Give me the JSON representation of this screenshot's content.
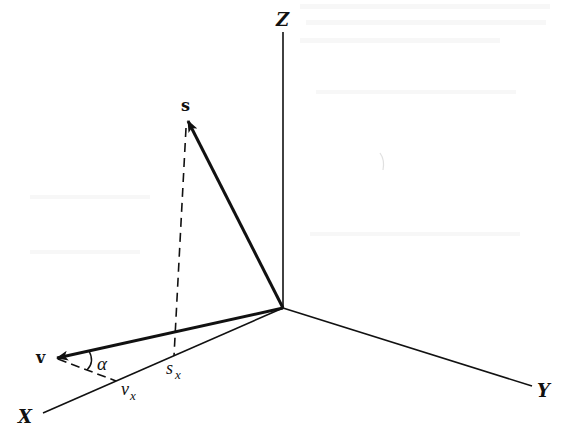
{
  "figure": {
    "axes": {
      "z_label": "Z",
      "y_label": "Y",
      "x_label": "X"
    },
    "vectors": {
      "s_label": "s",
      "v_label": "v"
    },
    "projections": {
      "sx_main": "s",
      "sx_sub": "x",
      "vx_main": "v",
      "vx_sub": "x"
    },
    "angle_label": "α",
    "colors": {
      "ink": "#111111",
      "paper": "#ffffff"
    }
  }
}
